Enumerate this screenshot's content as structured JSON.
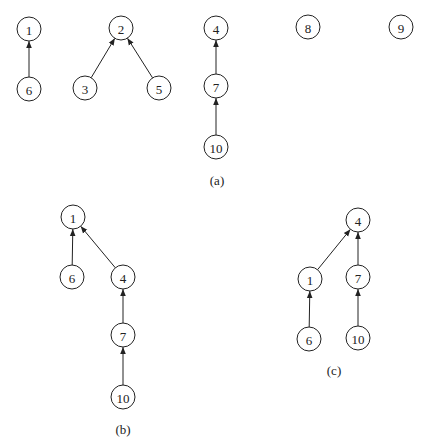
{
  "node_radius": 12,
  "stroke_color": "#222222",
  "panels": [
    {
      "id": "a",
      "caption": "(a)",
      "caption_pos": [
        217,
        180
      ],
      "nodes": [
        {
          "id": "a1",
          "label": "1",
          "x": 29,
          "y": 29
        },
        {
          "id": "a6",
          "label": "6",
          "x": 29,
          "y": 89
        },
        {
          "id": "a2",
          "label": "2",
          "x": 121,
          "y": 28
        },
        {
          "id": "a3",
          "label": "3",
          "x": 85,
          "y": 88
        },
        {
          "id": "a5",
          "label": "5",
          "x": 159,
          "y": 88
        },
        {
          "id": "a4",
          "label": "4",
          "x": 216,
          "y": 28
        },
        {
          "id": "a7",
          "label": "7",
          "x": 216,
          "y": 86
        },
        {
          "id": "a10",
          "label": "10",
          "x": 216,
          "y": 147
        },
        {
          "id": "a8",
          "label": "8",
          "x": 308,
          "y": 27
        },
        {
          "id": "a9",
          "label": "9",
          "x": 401,
          "y": 27
        }
      ],
      "edges": [
        {
          "from": "a6",
          "to": "a1"
        },
        {
          "from": "a3",
          "to": "a2"
        },
        {
          "from": "a5",
          "to": "a2"
        },
        {
          "from": "a7",
          "to": "a4"
        },
        {
          "from": "a10",
          "to": "a7"
        }
      ]
    },
    {
      "id": "b",
      "caption": "(b)",
      "caption_pos": [
        123,
        429
      ],
      "nodes": [
        {
          "id": "b1",
          "label": "1",
          "x": 73,
          "y": 217
        },
        {
          "id": "b6",
          "label": "6",
          "x": 72,
          "y": 277
        },
        {
          "id": "b4",
          "label": "4",
          "x": 123,
          "y": 277
        },
        {
          "id": "b7",
          "label": "7",
          "x": 123,
          "y": 335
        },
        {
          "id": "b10",
          "label": "10",
          "x": 123,
          "y": 397
        }
      ],
      "edges": [
        {
          "from": "b6",
          "to": "b1"
        },
        {
          "from": "b4",
          "to": "b1"
        },
        {
          "from": "b7",
          "to": "b4"
        },
        {
          "from": "b10",
          "to": "b7"
        }
      ]
    },
    {
      "id": "c",
      "caption": "(c)",
      "caption_pos": [
        334,
        370
      ],
      "nodes": [
        {
          "id": "c4",
          "label": "4",
          "x": 358,
          "y": 220
        },
        {
          "id": "c1",
          "label": "1",
          "x": 310,
          "y": 279
        },
        {
          "id": "c7",
          "label": "7",
          "x": 358,
          "y": 277
        },
        {
          "id": "c6",
          "label": "6",
          "x": 309,
          "y": 339
        },
        {
          "id": "c10",
          "label": "10",
          "x": 358,
          "y": 338
        }
      ],
      "edges": [
        {
          "from": "c1",
          "to": "c4"
        },
        {
          "from": "c7",
          "to": "c4"
        },
        {
          "from": "c6",
          "to": "c1"
        },
        {
          "from": "c10",
          "to": "c7"
        }
      ]
    }
  ]
}
